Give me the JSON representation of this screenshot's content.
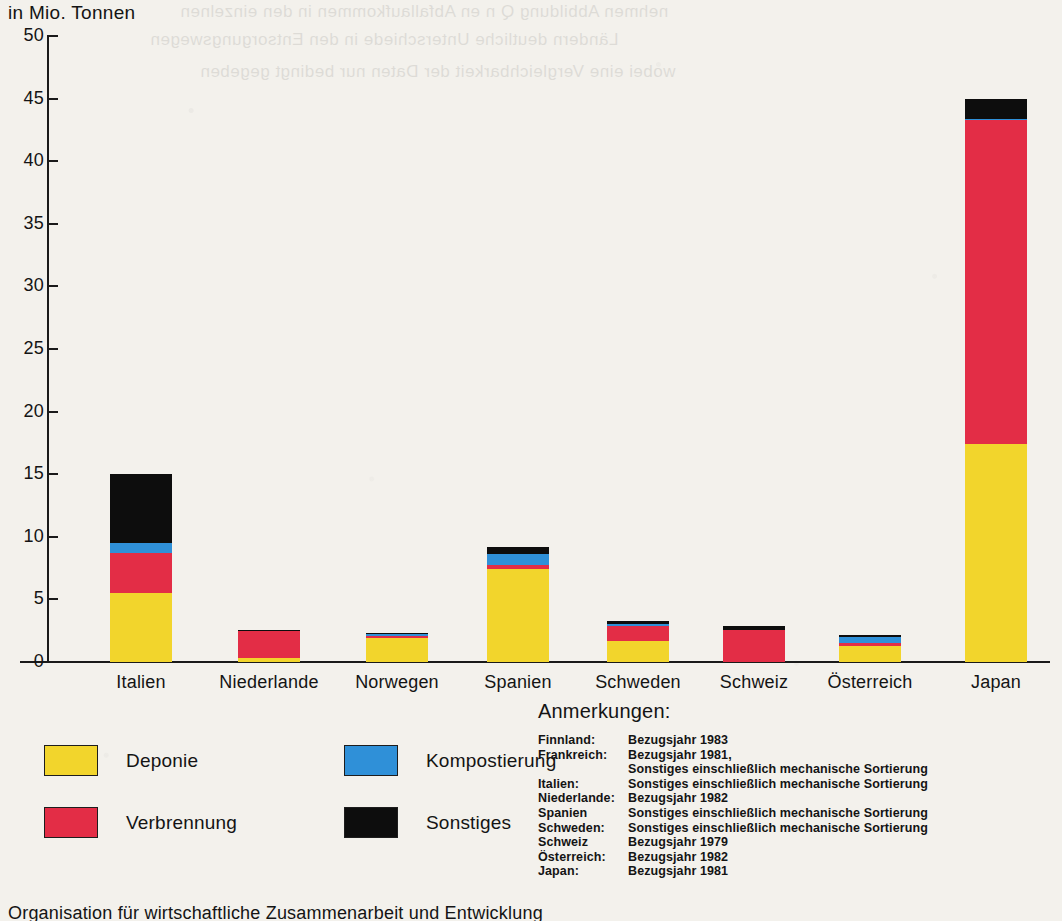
{
  "chart_data": {
    "type": "bar",
    "stacked": true,
    "title": "",
    "ylabel": "in Mio. Tonnen",
    "xlabel": "",
    "ylim": [
      0,
      50
    ],
    "yticks": [
      0,
      5,
      10,
      15,
      20,
      25,
      30,
      35,
      40,
      45,
      50
    ],
    "grid": false,
    "legend_position": "bottom-left",
    "categories": [
      "Italien",
      "Niederlande",
      "Norwegen",
      "Spanien",
      "Schweden",
      "Schweiz",
      "Österreich",
      "Japan"
    ],
    "series": [
      {
        "name": "Deponie",
        "color": "#f2d52c",
        "values": [
          5.5,
          0.35,
          1.9,
          7.4,
          1.7,
          0.0,
          1.25,
          17.4
        ]
      },
      {
        "name": "Verbrennung",
        "color": "#e32d46",
        "values": [
          3.2,
          2.1,
          0.15,
          0.35,
          1.15,
          2.55,
          0.3,
          25.9
        ]
      },
      {
        "name": "Kompostierung",
        "color": "#2f90d8",
        "values": [
          0.8,
          0.0,
          0.15,
          0.9,
          0.2,
          0.0,
          0.45,
          0.1
        ]
      },
      {
        "name": "Sonstiges",
        "color": "#0d0d0d",
        "values": [
          5.5,
          0.1,
          0.15,
          0.55,
          0.25,
          0.3,
          0.15,
          1.6
        ]
      }
    ],
    "totals": [
      15.0,
      2.55,
      2.35,
      9.2,
      3.3,
      2.85,
      2.15,
      45.0
    ]
  },
  "legend": {
    "items": [
      {
        "label": "Deponie",
        "color": "#f2d52c"
      },
      {
        "label": "Verbrennung",
        "color": "#e32d46"
      },
      {
        "label": "Kompostierung",
        "color": "#2f90d8"
      },
      {
        "label": "Sonstiges",
        "color": "#0d0d0d"
      }
    ]
  },
  "notes": {
    "title": "Anmerkungen:",
    "rows": [
      {
        "key": "Finnland:",
        "value": "Bezugsjahr 1983"
      },
      {
        "key": "Frankreich:",
        "value": "Bezugsjahr 1981,"
      },
      {
        "key": "",
        "value": "Sonstiges einschließlich mechanische Sortierung"
      },
      {
        "key": "Italien:",
        "value": "Sonstiges einschließlich mechanische Sortierung"
      },
      {
        "key": "Niederlande:",
        "value": "Bezugsjahr 1982"
      },
      {
        "key": "Spanien",
        "value": "Sonstiges einschließlich mechanische Sortierung"
      },
      {
        "key": "Schweden:",
        "value": "Sonstiges einschließlich mechanische Sortierung"
      },
      {
        "key": "Schweiz",
        "value": "Bezugsjahr 1979"
      },
      {
        "key": "Österreich:",
        "value": "Bezugsjahr 1982"
      },
      {
        "key": "Japan:",
        "value": "Bezugsjahr 1981"
      }
    ]
  },
  "footer": {
    "text": "Organisation für wirtschaftliche Zusammenarbeit und Entwicklung"
  },
  "bleed_through": {
    "lines": [
      "nehmen  Abbildung  Q  n  en  Abfallaufkommen  in  den  einzelnen",
      "Ländern  deutliche  Unterschiede  in  den  Entsorgungswegen",
      "wobei  eine  Vergleichbarkeit  der  Daten  nur  bedingt  gegeben"
    ]
  }
}
